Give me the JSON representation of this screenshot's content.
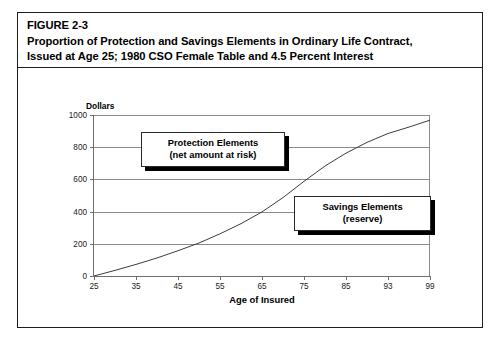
{
  "figure": {
    "number": "FIGURE 2-3",
    "title_line1": "Proportion of Protection and Savings Elements in Ordinary Life Contract,",
    "title_line2": "Issued at Age 25; 1980 CSO Female Table and 4.5 Percent Interest"
  },
  "callouts": {
    "protection": {
      "line1": "Protection Elements",
      "line2": "(net amount at risk)"
    },
    "savings": {
      "line1": "Savings Elements",
      "line2": "(reserve)"
    }
  },
  "colors": {
    "frame": "#1c1c1c",
    "gridline": "#8a8a8a",
    "axis": "#6f6f6f",
    "curve": "#3c3c3c",
    "background": "#ffffff",
    "text": "#000000"
  },
  "chart_data": {
    "type": "line",
    "title": "Proportion of Protection and Savings Elements in Ordinary Life Contract, Issued at Age 25; 1980 CSO Female Table and 4.5 Percent Interest",
    "xlabel": "Age of Insured",
    "ylabel": "Dollars",
    "grid": true,
    "legend": false,
    "xtick_labels": [
      "25",
      "35",
      "45",
      "55",
      "65",
      "75",
      "85",
      "93",
      "99"
    ],
    "ytick_labels": [
      "0",
      "200",
      "400",
      "600",
      "800",
      "1000"
    ],
    "ylim": [
      0,
      1000
    ],
    "yticks": [
      0,
      200,
      400,
      600,
      800,
      1000
    ],
    "x_positions_note": "x tick marks are evenly spaced even though label values 85, 93, 99 are unequal steps",
    "annotations": [
      {
        "text": "Protection Elements (net amount at risk)",
        "description": "region above the reserve curve, between the curve and the 1000 face amount"
      },
      {
        "text": "Savings Elements (reserve)",
        "description": "region below the reserve curve"
      }
    ],
    "series": [
      {
        "name": "Reserve (savings element)",
        "x": [
          25,
          30,
          35,
          40,
          45,
          50,
          55,
          60,
          65,
          70,
          75,
          80,
          85,
          89,
          93,
          96,
          99
        ],
        "values": [
          0,
          35,
          72,
          112,
          157,
          205,
          262,
          325,
          398,
          487,
          588,
          683,
          763,
          830,
          885,
          925,
          968
        ]
      }
    ]
  }
}
